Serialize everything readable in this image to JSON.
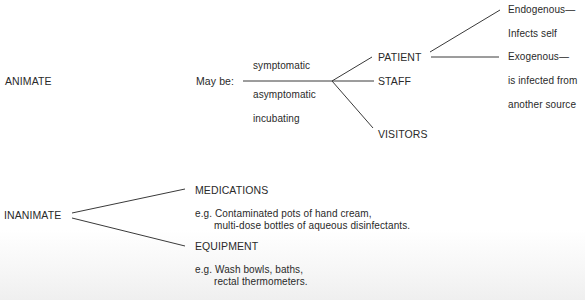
{
  "animate": {
    "label": "ANIMATE",
    "may_be_label": "May be:",
    "states": [
      "symptomatic",
      "asymptomatic",
      "incubating"
    ],
    "groups": [
      "PATIENT",
      "STAFF",
      "VISITORS"
    ],
    "patient_infection_types": [
      {
        "line1": "Endogenous—",
        "line2": "Infects self"
      },
      {
        "line1": "Exogenous—",
        "line2": "is infected from",
        "line3": "another source"
      }
    ]
  },
  "inanimate": {
    "label": "INANIMATE",
    "categories": [
      {
        "name": "MEDICATIONS",
        "example_line1": "e.g. Contaminated pots of hand cream,",
        "example_line2": "multi-dose bottles of aqueous disinfectants."
      },
      {
        "name": "EQUIPMENT",
        "example_line1": "e.g. Wash bowls, baths,",
        "example_line2": "rectal thermometers."
      }
    ]
  },
  "colors": {
    "text": "#2a2a2a",
    "lines": "#3a3a3a",
    "background": "#ffffff"
  }
}
